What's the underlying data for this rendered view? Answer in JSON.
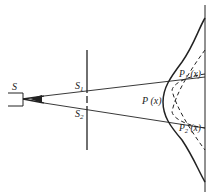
{
  "diagram": {
    "labels": {
      "source": "S",
      "slit1": "S",
      "slit1_sub": "1",
      "slit2": "S",
      "slit2_sub": "2",
      "p_total": "P (x)",
      "p1": "P",
      "p1_sub": "1",
      "p1_arg": " (x)",
      "p2": "P",
      "p2_sub": "2",
      "p2_arg": " (x)"
    },
    "colors": {
      "line": "#222222",
      "background": "#ffffff"
    }
  }
}
